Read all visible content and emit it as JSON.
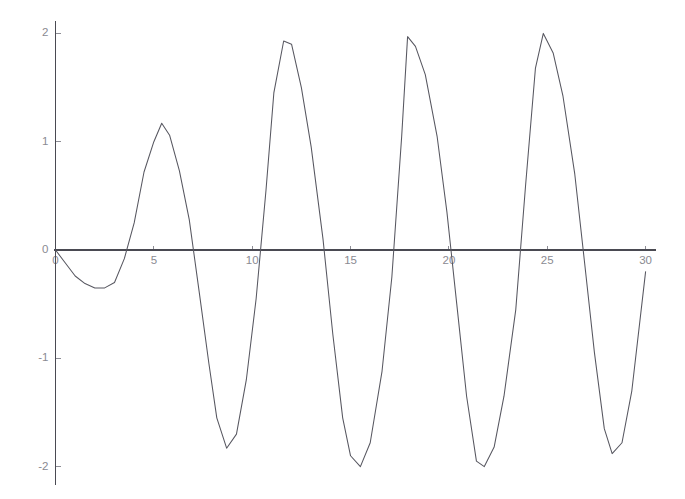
{
  "chart_data": {
    "type": "line",
    "title": "",
    "subtitle": "",
    "xlabel": "",
    "ylabel": "",
    "xlim": [
      0,
      30
    ],
    "ylim": [
      -2,
      2
    ],
    "xticks": [
      0,
      5,
      10,
      15,
      20,
      25,
      30
    ],
    "yticks": [
      -2,
      -1,
      0,
      1,
      2
    ],
    "xtick_labels": [
      "0",
      "5",
      "10",
      "15",
      "20",
      "25",
      "30"
    ],
    "ytick_labels": [
      "-2",
      "-1",
      "0",
      "1",
      "2"
    ],
    "grid": false,
    "legend": false,
    "legend_position": "none",
    "line_color": "#575760",
    "axis_color": "#4a4a52",
    "tick_label_color": "#8a8a92",
    "background_color": "#ffffff",
    "annotations": [],
    "series": [
      {
        "name": "signal",
        "x": [
          0.0,
          0.5,
          1.0,
          1.5,
          2.0,
          2.5,
          3.0,
          3.5,
          4.0,
          4.5,
          5.0,
          5.4,
          5.8,
          6.3,
          6.8,
          7.3,
          7.8,
          8.2,
          8.7,
          9.2,
          9.7,
          10.2,
          10.7,
          11.1,
          11.6,
          12.0,
          12.5,
          13.0,
          13.6,
          14.1,
          14.6,
          15.0,
          15.5,
          16.0,
          16.6,
          17.1,
          17.6,
          17.9,
          18.3,
          18.8,
          19.4,
          19.9,
          20.4,
          20.9,
          21.4,
          21.8,
          22.3,
          22.8,
          23.4,
          23.9,
          24.4,
          24.8,
          25.3,
          25.8,
          26.4,
          26.9,
          27.4,
          27.9,
          28.3,
          28.8,
          29.3,
          30.0
        ],
        "y": [
          0.0,
          -0.12,
          -0.24,
          -0.31,
          -0.35,
          -0.35,
          -0.3,
          -0.08,
          0.25,
          0.72,
          1.0,
          1.17,
          1.06,
          0.73,
          0.28,
          -0.38,
          -1.05,
          -1.55,
          -1.83,
          -1.7,
          -1.2,
          -0.45,
          0.55,
          1.45,
          1.93,
          1.9,
          1.5,
          0.95,
          0.1,
          -0.78,
          -1.55,
          -1.9,
          -2.0,
          -1.78,
          -1.12,
          -0.25,
          1.05,
          1.97,
          1.88,
          1.62,
          1.05,
          0.35,
          -0.5,
          -1.35,
          -1.95,
          -2.0,
          -1.82,
          -1.35,
          -0.55,
          0.6,
          1.68,
          2.0,
          1.82,
          1.42,
          0.7,
          -0.12,
          -0.95,
          -1.65,
          -1.88,
          -1.78,
          -1.3,
          -0.2
        ]
      }
    ]
  },
  "axes": {
    "x_axis_name": "x-axis",
    "y_axis_name": "y-axis"
  }
}
